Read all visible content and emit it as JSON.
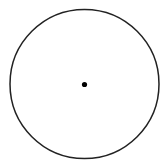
{
  "diagram": {
    "background": "#ffffff",
    "circle": {
      "cx": 84.5,
      "cy": 84,
      "r": 74.5,
      "stroke": "#222222",
      "stroke_width": 1.5,
      "fill": "none"
    },
    "center_point": {
      "cx": 84.5,
      "cy": 84.5,
      "r": 2.6,
      "fill": "#000000"
    }
  }
}
